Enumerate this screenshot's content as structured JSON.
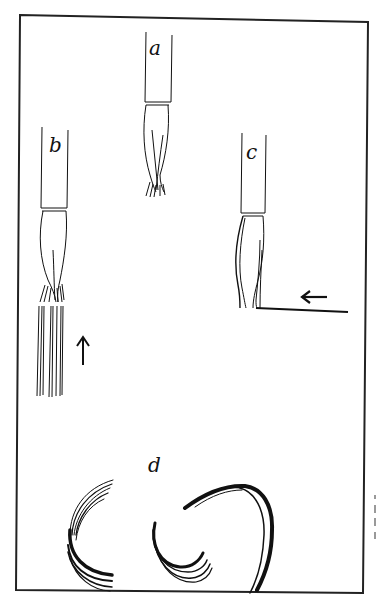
{
  "figure": {
    "panels": [
      {
        "id": "a",
        "label": "a",
        "description": "brush held vertically with splayed tip"
      },
      {
        "id": "b",
        "label": "b",
        "description": "brush with tip spread, producing parallel strokes",
        "arrow": "up"
      },
      {
        "id": "c",
        "label": "c",
        "description": "brush dragged horizontally along a line",
        "arrow": "left"
      },
      {
        "id": "d",
        "label": "d",
        "description": "curved dry-brush strokes"
      }
    ],
    "colors": {
      "ink": "#111111",
      "paper": "#ffffff",
      "frame": "#222222"
    }
  }
}
